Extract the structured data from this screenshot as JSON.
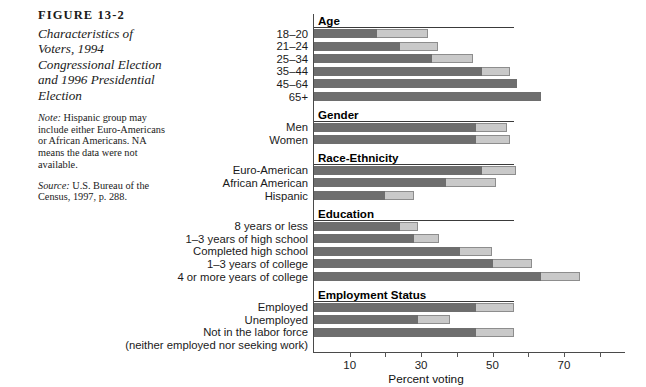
{
  "caption": {
    "figure_number": "FIGURE 13-2",
    "title": "Characteristics of Voters, 1994 Congressional Election and 1996 Presidential Election",
    "note_lead": "Note:",
    "note_text": " Hispanic group may include either Euro-Americans or African Americans. NA means the data were not available.",
    "source_lead": "Source:",
    "source_text": " U.S. Bureau of the Census, 1997, p. 288."
  },
  "colors": {
    "dark_segment": "#6e6e6e",
    "light_segment": "#c9c9c9",
    "axis": "#4a4a4a",
    "text": "#1a1a1a"
  },
  "chart_data": {
    "type": "bar",
    "orientation": "horizontal",
    "stacked": true,
    "title": "Characteristics of Voters, 1994 Congressional Election and 1996 Presidential Election",
    "xlabel": "Percent voting",
    "ylabel": "",
    "xlim": [
      0,
      80
    ],
    "xticks": [
      10,
      20,
      30,
      40,
      50,
      60,
      70,
      80
    ],
    "xtick_labels": [
      "10",
      "",
      "30",
      "",
      "50",
      "",
      "70",
      ""
    ],
    "grid": false,
    "legend": [],
    "series": [
      {
        "name": "1994 Congressional Election",
        "color": "#6e6e6e"
      },
      {
        "name": "1996 Presidential Election",
        "color": "#c9c9c9"
      }
    ],
    "sections": [
      {
        "header": "Age",
        "rows": [
          {
            "label": "18–20",
            "dark": 17.6,
            "total": 32.0
          },
          {
            "label": "21–24",
            "dark": 24.0,
            "total": 34.7
          },
          {
            "label": "25–34",
            "dark": 33.0,
            "total": 44.5
          },
          {
            "label": "35–44",
            "dark": 47.0,
            "total": 55.0
          },
          {
            "label": "45–64",
            "dark": 57.0,
            "total": 57.0
          },
          {
            "label": "65+",
            "dark": 63.5,
            "total": 63.5
          }
        ]
      },
      {
        "header": "Gender",
        "rows": [
          {
            "label": "Men",
            "dark": 45.5,
            "total": 54.0
          },
          {
            "label": "Women",
            "dark": 45.5,
            "total": 55.0
          }
        ]
      },
      {
        "header": "Race-Ethnicity",
        "rows": [
          {
            "label": "Euro-American",
            "dark": 47.0,
            "total": 56.5
          },
          {
            "label": "African American",
            "dark": 37.0,
            "total": 51.0
          },
          {
            "label": "Hispanic",
            "dark": 20.0,
            "total": 28.0
          }
        ]
      },
      {
        "header": "Education",
        "rows": [
          {
            "label": "8 years or less",
            "dark": 24.0,
            "total": 29.0
          },
          {
            "label": "1–3 years of high school",
            "dark": 28.0,
            "total": 35.0
          },
          {
            "label": "Completed high school",
            "dark": 41.0,
            "total": 50.0
          },
          {
            "label": "1–3 years of college",
            "dark": 50.0,
            "total": 61.0
          },
          {
            "label": "4 or more years of college",
            "dark": 63.5,
            "total": 74.5
          }
        ]
      },
      {
        "header": "Employment Status",
        "rows": [
          {
            "label": "Employed",
            "dark": 45.5,
            "total": 56.0
          },
          {
            "label": "Unemployed",
            "dark": 29.0,
            "total": 38.0
          },
          {
            "label": "Not in the labor force",
            "dark": 45.5,
            "total": 56.0
          },
          {
            "label": "(neither employed nor seeking work)",
            "dark": null,
            "total": null
          }
        ]
      }
    ]
  }
}
